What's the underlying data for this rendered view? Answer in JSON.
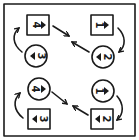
{
  "diagram": {
    "title": "",
    "ink_color": "#1a1a1a",
    "background": "#ffffff",
    "cells": [
      {
        "id": "top-left",
        "upper": {
          "shape": "square",
          "digit": "4",
          "digit_rotation_deg": 90,
          "pointer": "right"
        },
        "lower": {
          "shape": "circle",
          "digit": "3",
          "digit_rotation_deg": 90,
          "pointer": "left"
        },
        "curve_arrow": "lower-to-upper"
      },
      {
        "id": "top-right",
        "upper": {
          "shape": "square",
          "digit": "1",
          "digit_rotation_deg": 90,
          "pointer": "right"
        },
        "lower": {
          "shape": "circle",
          "digit": "2",
          "digit_rotation_deg": 90,
          "pointer": "left"
        },
        "curve_arrow": "upper-to-lower"
      },
      {
        "id": "bottom-left",
        "upper": {
          "shape": "circle",
          "digit": "4",
          "digit_rotation_deg": 90,
          "pointer": "right"
        },
        "lower": {
          "shape": "square",
          "digit": "3",
          "digit_rotation_deg": 90,
          "pointer": "left"
        },
        "curve_arrow": "lower-to-upper"
      },
      {
        "id": "bottom-right",
        "upper": {
          "shape": "circle",
          "digit": "1",
          "digit_rotation_deg": 90,
          "pointer": "right"
        },
        "lower": {
          "shape": "square",
          "digit": "2",
          "digit_rotation_deg": 90,
          "pointer": "left"
        },
        "curve_arrow": "upper-to-lower"
      }
    ],
    "center_arrows": [
      {
        "from": "top-left.upper",
        "direction": "toward-center"
      },
      {
        "from": "top-right.lower",
        "direction": "toward-center"
      },
      {
        "from": "bottom-left.upper",
        "direction": "toward-center"
      },
      {
        "from": "bottom-right.lower",
        "direction": "toward-center"
      }
    ]
  }
}
